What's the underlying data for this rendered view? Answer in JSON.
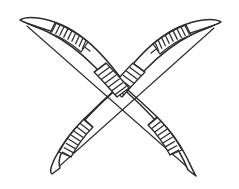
{
  "artwork": {
    "title": "Crossed Bows",
    "subject": "two traditional archery bows crossed in an X formation",
    "style": "black ink line drawing, white background, no shading",
    "background_color": "#ffffff",
    "ink_color": "#2b2b2b",
    "canvas": {
      "width": 239,
      "height": 189
    },
    "stroke_width": 1.5
  },
  "objects": [
    {
      "id": "bow-left",
      "name": "bow-upper-left-to-lower-right",
      "description": "bow whose upper limb points to the upper left and lower limb points to the lower right",
      "orientation": "upper-left to lower-right",
      "z_order": 1,
      "tips": [
        {
          "name": "upper-left-tip",
          "x": 20,
          "y": 20,
          "shape": "rounded-flared-nock"
        },
        {
          "name": "lower-right-tip",
          "x": 196,
          "y": 176,
          "shape": "pointed-taper"
        }
      ],
      "bindings": [
        {
          "name": "upper-left-binding",
          "stripe_count": 10,
          "position": "near upper tip"
        },
        {
          "name": "center-grip-binding",
          "stripe_count": 7,
          "position": "center crossing"
        },
        {
          "name": "lower-right-binding",
          "stripe_count": 10,
          "position": "near lower tip"
        }
      ],
      "bowstring": {
        "from": [
          26,
          25
        ],
        "to": [
          193,
          172
        ]
      }
    },
    {
      "id": "bow-right",
      "name": "bow-upper-right-to-lower-left",
      "description": "bow whose upper limb points to the upper right and lower limb points to the lower left",
      "orientation": "upper-right to lower-left",
      "z_order": 2,
      "tips": [
        {
          "name": "upper-right-tip",
          "x": 221,
          "y": 22,
          "shape": "rounded-flared-nock"
        },
        {
          "name": "lower-left-tip",
          "x": 52,
          "y": 174,
          "shape": "pointed-taper"
        }
      ],
      "bindings": [
        {
          "name": "upper-right-binding",
          "stripe_count": 10,
          "position": "near upper tip"
        },
        {
          "name": "center-grip-binding",
          "stripe_count": 7,
          "position": "center crossing"
        },
        {
          "name": "lower-left-binding",
          "stripe_count": 10,
          "position": "near lower tip"
        }
      ],
      "bowstring": {
        "from": [
          215,
          27
        ],
        "to": [
          55,
          170
        ]
      }
    }
  ],
  "crossing": {
    "name": "center-crossing",
    "x": 119,
    "y": 80,
    "description": "the two wrapped grip sections overlap forming a woven X pattern"
  },
  "labels": {
    "caption": "",
    "alt_text": "Line drawing of two crossed bows with wrapped bindings"
  }
}
